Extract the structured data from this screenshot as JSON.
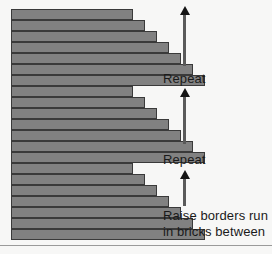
{
  "figure": {
    "background_color": "#f7f7f6",
    "brick_fill_color": "#818181",
    "brick_border_color": "#3a3a3a",
    "text_color": "#1a1a1a",
    "arrow_color": "#5a5a5a",
    "rule_color": "#9a9a9a"
  },
  "brick_diagram": {
    "left_margin_px": 11,
    "course_height_px": 11,
    "groups": [
      {
        "name": "repeat-group-top",
        "top_px": 9,
        "courses": [
          {
            "index": 1,
            "width_px": 122,
            "top_px": 0
          },
          {
            "index": 2,
            "width_px": 134,
            "top_px": 11
          },
          {
            "index": 3,
            "width_px": 146,
            "top_px": 22
          },
          {
            "index": 4,
            "width_px": 158,
            "top_px": 33
          },
          {
            "index": 5,
            "width_px": 170,
            "top_px": 44
          },
          {
            "index": 6,
            "width_px": 182,
            "top_px": 55
          },
          {
            "index": 7,
            "width_px": 194,
            "top_px": 66
          }
        ]
      },
      {
        "name": "repeat-group-middle",
        "top_px": 86,
        "courses": [
          {
            "index": 1,
            "width_px": 122,
            "top_px": 0
          },
          {
            "index": 2,
            "width_px": 134,
            "top_px": 11
          },
          {
            "index": 3,
            "width_px": 146,
            "top_px": 22
          },
          {
            "index": 4,
            "width_px": 158,
            "top_px": 33
          },
          {
            "index": 5,
            "width_px": 170,
            "top_px": 44
          },
          {
            "index": 6,
            "width_px": 182,
            "top_px": 55
          },
          {
            "index": 7,
            "width_px": 194,
            "top_px": 66
          }
        ]
      },
      {
        "name": "base-group-bottom",
        "top_px": 163,
        "courses": [
          {
            "index": 1,
            "width_px": 122,
            "top_px": 0
          },
          {
            "index": 2,
            "width_px": 134,
            "top_px": 11
          },
          {
            "index": 3,
            "width_px": 146,
            "top_px": 22
          },
          {
            "index": 4,
            "width_px": 158,
            "top_px": 33
          },
          {
            "index": 5,
            "width_px": 170,
            "top_px": 44
          },
          {
            "index": 6,
            "width_px": 182,
            "top_px": 55
          },
          {
            "index": 7,
            "width_px": 194,
            "top_px": 66
          }
        ]
      }
    ]
  },
  "annotations": {
    "arrows": [
      {
        "name": "repeat-arrow-top",
        "top_px": 14,
        "height_px": 52
      },
      {
        "name": "repeat-arrow-middle",
        "top_px": 96,
        "height_px": 48
      },
      {
        "name": "base-arrow-bottom",
        "top_px": 178,
        "height_px": 28
      }
    ],
    "labels": [
      {
        "name": "repeat-label-top",
        "text": "Repeat",
        "top_px": 71
      },
      {
        "name": "repeat-label-middle",
        "text": "Repeat",
        "top_px": 152
      }
    ],
    "caption": {
      "name": "base-caption",
      "top_px": 208,
      "line1": "Raise borders run",
      "line2": "in bricks between"
    }
  }
}
